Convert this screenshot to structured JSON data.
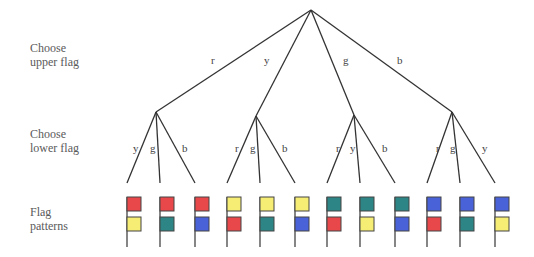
{
  "row_labels": {
    "upper": [
      "Choose",
      "upper flag"
    ],
    "lower": [
      "Choose",
      "lower flag"
    ],
    "patterns": [
      "Flag",
      "patterns"
    ]
  },
  "colors": {
    "r": "#e8484a",
    "y": "#f6ee74",
    "g": "#2e8585",
    "b": "#4a62d8"
  },
  "tree": {
    "root": {
      "x": 311,
      "y": 10
    },
    "upper_edges": [
      {
        "label": "r",
        "node": {
          "x": 156,
          "y": 112
        },
        "label_pos": {
          "x": 211,
          "y": 64
        }
      },
      {
        "label": "y",
        "node": {
          "x": 256,
          "y": 116
        },
        "label_pos": {
          "x": 264,
          "y": 64
        }
      },
      {
        "label": "g",
        "node": {
          "x": 354,
          "y": 115
        },
        "label_pos": {
          "x": 343,
          "y": 64
        }
      },
      {
        "label": "b",
        "node": {
          "x": 452,
          "y": 112
        },
        "label_pos": {
          "x": 397,
          "y": 64
        }
      }
    ],
    "branch_bottom_y": 183,
    "groups": [
      {
        "upper": "r",
        "node_index": 0,
        "leaves": [
          {
            "label": "y",
            "x": 127,
            "label_pos": {
              "x": 133,
              "y": 152
            }
          },
          {
            "label": "g",
            "x": 160,
            "label_pos": {
              "x": 150,
              "y": 152
            }
          },
          {
            "label": "b",
            "x": 195,
            "label_pos": {
              "x": 182,
              "y": 152
            }
          }
        ]
      },
      {
        "upper": "y",
        "node_index": 1,
        "leaves": [
          {
            "label": "r",
            "x": 227,
            "label_pos": {
              "x": 235,
              "y": 152
            }
          },
          {
            "label": "g",
            "x": 260,
            "label_pos": {
              "x": 250,
              "y": 152
            }
          },
          {
            "label": "b",
            "x": 295,
            "label_pos": {
              "x": 282,
              "y": 152
            }
          }
        ]
      },
      {
        "upper": "g",
        "node_index": 2,
        "leaves": [
          {
            "label": "r",
            "x": 327,
            "label_pos": {
              "x": 336,
              "y": 152
            }
          },
          {
            "label": "y",
            "x": 360,
            "label_pos": {
              "x": 350,
              "y": 152
            }
          },
          {
            "label": "b",
            "x": 395,
            "label_pos": {
              "x": 382,
              "y": 152
            }
          }
        ]
      },
      {
        "upper": "b",
        "node_index": 3,
        "leaves": [
          {
            "label": "r",
            "x": 427,
            "label_pos": {
              "x": 436,
              "y": 152
            }
          },
          {
            "label": "g",
            "x": 460,
            "label_pos": {
              "x": 450,
              "y": 152
            }
          },
          {
            "label": "y",
            "x": 495,
            "label_pos": {
              "x": 482,
              "y": 152
            }
          }
        ]
      }
    ]
  },
  "flag_patterns": [
    {
      "upper": "r",
      "lower": "y"
    },
    {
      "upper": "r",
      "lower": "g"
    },
    {
      "upper": "r",
      "lower": "b"
    },
    {
      "upper": "y",
      "lower": "r"
    },
    {
      "upper": "y",
      "lower": "g"
    },
    {
      "upper": "y",
      "lower": "b"
    },
    {
      "upper": "g",
      "lower": "r"
    },
    {
      "upper": "g",
      "lower": "y"
    },
    {
      "upper": "g",
      "lower": "b"
    },
    {
      "upper": "b",
      "lower": "r"
    },
    {
      "upper": "b",
      "lower": "g"
    },
    {
      "upper": "b",
      "lower": "y"
    }
  ]
}
